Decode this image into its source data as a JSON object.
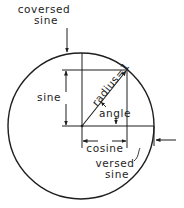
{
  "diagram": {
    "labels": {
      "coversed_line1": "coversed",
      "coversed_line2": "sine",
      "sine": "sine",
      "radius": "radius=1",
      "angle": "angle",
      "cosine": "cosine",
      "versed_line1": "versed",
      "versed_line2": "sine"
    },
    "colors": {
      "stroke": "#1e1e1e",
      "background": "#ffffff"
    }
  }
}
